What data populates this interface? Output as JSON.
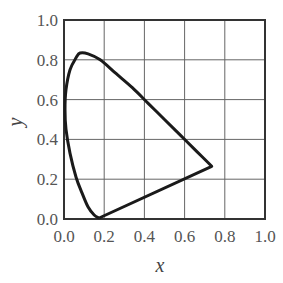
{
  "chart_data": {
    "type": "line",
    "title": "",
    "xlabel": "x",
    "ylabel": "y",
    "xlim": [
      0.0,
      1.0
    ],
    "ylim": [
      0.0,
      1.0
    ],
    "grid": true,
    "legend": null,
    "x_ticks": [
      "0.0",
      "0.2",
      "0.4",
      "0.6",
      "0.8",
      "1.0"
    ],
    "y_ticks": [
      "0.0",
      "0.2",
      "0.4",
      "0.6",
      "0.8",
      "1.0"
    ],
    "series": [
      {
        "name": "CIE 1931 chromaticity locus (spectral locus + purple line)",
        "points": [
          [
            0.175,
            0.005
          ],
          [
            0.15,
            0.02
          ],
          [
            0.12,
            0.06
          ],
          [
            0.09,
            0.13
          ],
          [
            0.06,
            0.21
          ],
          [
            0.03,
            0.33
          ],
          [
            0.01,
            0.45
          ],
          [
            0.005,
            0.55
          ],
          [
            0.01,
            0.65
          ],
          [
            0.03,
            0.75
          ],
          [
            0.06,
            0.81
          ],
          [
            0.08,
            0.834
          ],
          [
            0.12,
            0.83
          ],
          [
            0.18,
            0.8
          ],
          [
            0.26,
            0.73
          ],
          [
            0.34,
            0.66
          ],
          [
            0.42,
            0.58
          ],
          [
            0.5,
            0.5
          ],
          [
            0.58,
            0.42
          ],
          [
            0.66,
            0.34
          ],
          [
            0.735,
            0.265
          ],
          [
            0.175,
            0.005
          ]
        ]
      }
    ]
  },
  "colors": {
    "curve": "#1a1a1a",
    "grid": "#666666",
    "frame": "#333333",
    "text": "#555555"
  }
}
